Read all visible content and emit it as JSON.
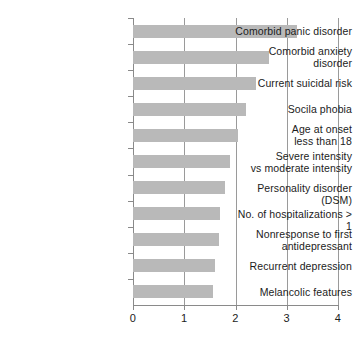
{
  "chart_data": {
    "type": "bar",
    "orientation": "horizontal",
    "title": "",
    "subtitle": "",
    "xlabel": "",
    "ylabel": "",
    "xlim": [
      0,
      4
    ],
    "ylim": null,
    "grid": "vertical gridlines at each integer x tick",
    "legend": null,
    "legend_position": "none",
    "bar_color": "#b9b9b9",
    "axis_color": "#8a8a8a",
    "text_color": "#1c1c1c",
    "xticks": [
      "0",
      "1",
      "2",
      "3",
      "4"
    ],
    "xtick_values": [
      0,
      1,
      2,
      3,
      4
    ],
    "categories": [
      "Comorbid panic disorder",
      "Comorbid anxiety disorder",
      "Current suicidal risk",
      "Socila phobia",
      "Age at onset less than 18",
      "Severe intensity vs moderate intensity",
      "Personality disorder (DSM)",
      "No. of hospitalizations > 1",
      "Nonresponse to first antidepressant",
      "Recurrent depression",
      "Melancolic features"
    ],
    "category_lines": [
      [
        "Comorbid panic disorder"
      ],
      [
        "Comorbid anxiety",
        "disorder"
      ],
      [
        "Current suicidal risk"
      ],
      [
        "Socila phobia"
      ],
      [
        "Age at onset",
        "less than 18"
      ],
      [
        "Severe intensity",
        "vs moderate intensity"
      ],
      [
        "Personality disorder (DSM)"
      ],
      [
        "No. of hospitalizations > 1"
      ],
      [
        "Nonresponse to first",
        "antidepressant"
      ],
      [
        "Recurrent depression"
      ],
      [
        "Melancolic features"
      ]
    ],
    "values": [
      3.2,
      2.65,
      2.4,
      2.2,
      2.05,
      1.9,
      1.8,
      1.7,
      1.68,
      1.6,
      1.57
    ]
  }
}
